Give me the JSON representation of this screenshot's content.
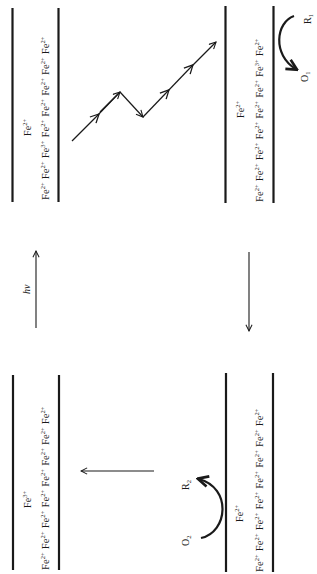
{
  "figure": {
    "orientation": "rotated-90-ccw",
    "panels": [
      {
        "id": "top-left",
        "position": "top-left",
        "surface_label": "Fe",
        "surface_label_charge": "2+",
        "chain": [
          {
            "el": "Fe",
            "charge": "2+"
          },
          {
            "el": "Fe",
            "charge": "2+"
          },
          {
            "el": "Fe",
            "charge": "3+"
          },
          {
            "el": "Fe",
            "charge": "2+"
          },
          {
            "el": "Fe",
            "charge": "2+"
          },
          {
            "el": "Fe",
            "charge": "2+"
          },
          {
            "el": "Fe",
            "charge": "2+"
          },
          {
            "el": "Fe",
            "charge": "2+"
          }
        ]
      },
      {
        "id": "top-right",
        "position": "top-right",
        "surface_label": "Fe",
        "surface_label_charge": "2+",
        "chain": [
          {
            "el": "Fe",
            "charge": "2+"
          },
          {
            "el": "Fe",
            "charge": "2+"
          },
          {
            "el": "Fe",
            "charge": "2+"
          },
          {
            "el": "Fe",
            "charge": "2+"
          },
          {
            "el": "Fe",
            "charge": "2+"
          },
          {
            "el": "Fe",
            "charge": "2+"
          },
          {
            "el": "Fe",
            "charge": "3+"
          },
          {
            "el": "Fe",
            "charge": "2+"
          }
        ],
        "reaction": {
          "reduced": "R",
          "reduced_sub": "1",
          "oxidized": "O",
          "oxidized_sub": "1"
        }
      },
      {
        "id": "bottom-left",
        "position": "bottom-left",
        "surface_label": "Fe",
        "surface_label_charge": "3+",
        "chain": [
          {
            "el": "Fe",
            "charge": "2+"
          },
          {
            "el": "Fe",
            "charge": "2+"
          },
          {
            "el": "Fe",
            "charge": "2+"
          },
          {
            "el": "Fe",
            "charge": "2+"
          },
          {
            "el": "Fe",
            "charge": "2+"
          },
          {
            "el": "Fe",
            "charge": "2+"
          },
          {
            "el": "Fe",
            "charge": "2+"
          },
          {
            "el": "Fe",
            "charge": "2+"
          }
        ]
      },
      {
        "id": "bottom-right",
        "position": "bottom-right",
        "surface_label": "Fe",
        "surface_label_charge": "2+",
        "chain": [
          {
            "el": "Fe",
            "charge": "2+"
          },
          {
            "el": "Fe",
            "charge": "2+"
          },
          {
            "el": "Fe",
            "charge": "2+"
          },
          {
            "el": "Fe",
            "charge": "2+"
          },
          {
            "el": "Fe",
            "charge": "2+"
          },
          {
            "el": "Fe",
            "charge": "2+"
          },
          {
            "el": "Fe",
            "charge": "2+"
          },
          {
            "el": "Fe",
            "charge": "2+"
          }
        ],
        "reaction": {
          "oxidized": "O",
          "oxidized_sub": "2",
          "reduced": "R",
          "reduced_sub": "2"
        }
      }
    ],
    "arrows": {
      "excitation_label": "hν"
    }
  }
}
